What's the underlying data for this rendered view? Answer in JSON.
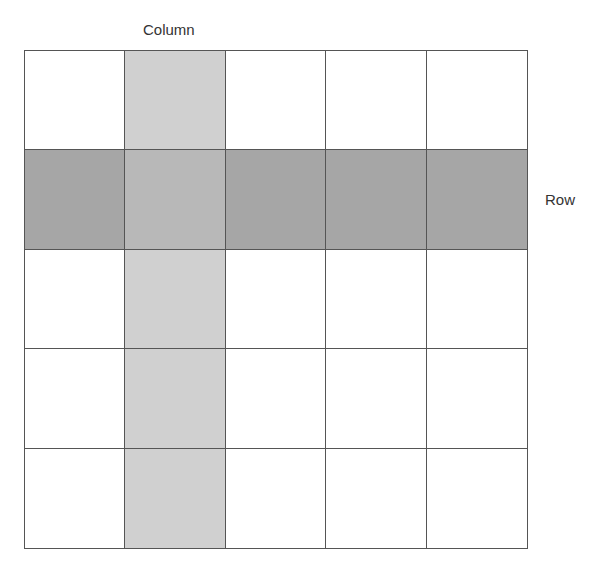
{
  "diagram": {
    "column_label": "Column",
    "row_label": "Row",
    "grid": {
      "rows": 5,
      "columns": 5,
      "highlighted_row_index": 2,
      "highlighted_column_index": 2
    },
    "colors": {
      "column_fill": "#d0d0d0",
      "row_fill": "#a6a6a6",
      "intersection_fill": "#b8b8b8",
      "cell_fill": "#ffffff",
      "line": "#555555"
    }
  }
}
